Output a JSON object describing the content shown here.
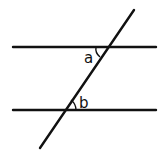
{
  "diagram": {
    "type": "parallel-lines-transversal",
    "stroke_color": "#111111",
    "background": "#ffffff",
    "lines": {
      "top_parallel": {
        "x1": 13,
        "y1": 47,
        "x2": 156,
        "y2": 47
      },
      "bottom_parallel": {
        "x1": 13,
        "y1": 110,
        "x2": 156,
        "y2": 110
      },
      "transversal": {
        "x1": 134,
        "y1": 10,
        "x2": 40,
        "y2": 148
      }
    },
    "angles": [
      {
        "label": "a",
        "x": 84,
        "y": 63
      },
      {
        "label": "b",
        "x": 79,
        "y": 108
      }
    ]
  }
}
